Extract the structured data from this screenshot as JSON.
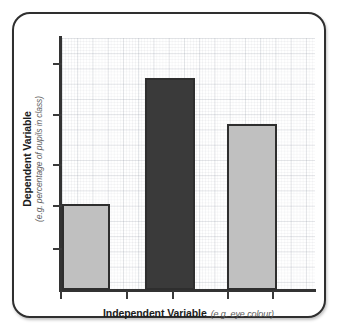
{
  "figure": {
    "frame_border_color": "#2f2f2f",
    "background_color": "#ffffff"
  },
  "axes": {
    "y": {
      "title": "Dependent Variable",
      "subtitle": "(e.g. percentage of pupils in class)",
      "tick_count": 5,
      "tick_labels": []
    },
    "x": {
      "title": "Independent Variable",
      "subtitle": "(e.g. eye colour)",
      "tick_count": 5,
      "tick_labels": []
    }
  },
  "chart_data": {
    "type": "bar",
    "title": "",
    "xlabel": "Independent Variable (e.g. eye colour)",
    "ylabel": "Dependent Variable (e.g. percentage of pupils in class)",
    "categories": [
      "1",
      "2",
      "3"
    ],
    "values": [
      34,
      84,
      66
    ],
    "ylim": [
      0,
      100
    ],
    "xlim": [
      0,
      100
    ],
    "grid": true,
    "grid_style": "graph-paper",
    "legend": "none",
    "tick_labels_shown": false,
    "bars": [
      {
        "category": "1",
        "value": 34,
        "fill": "#c0c0c0",
        "stroke": "#2e2e2e",
        "highlighted": false
      },
      {
        "category": "2",
        "value": 84,
        "fill": "#3a3a3a",
        "stroke": "#2e2e2e",
        "highlighted": true
      },
      {
        "category": "3",
        "value": 66,
        "fill": "#c0c0c0",
        "stroke": "#2e2e2e",
        "highlighted": false
      }
    ]
  }
}
